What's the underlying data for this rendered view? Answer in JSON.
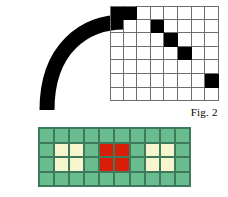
{
  "figure": {
    "caption": "Fig. 2",
    "colors": {
      "ink": "#000000",
      "grid_line": "#6e6e6e",
      "green": "#69bc8e",
      "cream": "#f7f5ce",
      "red": "#d81e09",
      "cell_border": "#3d7a5c",
      "background": "#ffffff"
    }
  },
  "pixel_grid": {
    "name": "rasterized-curve-grid",
    "columns": 8,
    "rows": 7,
    "cell_size": 13.6,
    "origin_x": 110,
    "origin_y": 6,
    "filled_cells": [
      [
        0,
        0
      ],
      [
        0,
        1
      ],
      [
        1,
        3
      ],
      [
        2,
        4
      ],
      [
        3,
        5
      ],
      [
        5,
        7
      ]
    ],
    "description": "Staircase of black pixels approximating a quarter-circle arc"
  },
  "arc": {
    "name": "thick-black-arc",
    "stroke_color": "#000000",
    "stroke_width": 15,
    "path": "M 47 110 C 47 48 85 22 124 22",
    "description": "Thick smooth quarter-arc meeting the top-left of the pixel grid"
  },
  "color_grid": {
    "name": "color-cell-grid",
    "columns": 10,
    "rows": 4,
    "origin_x": 38,
    "origin_y": 127,
    "cell_width": 15.1,
    "cell_height": 14.6,
    "legend": {
      "green": "background cell",
      "cream": "highlighted pair",
      "red": "center pair"
    },
    "cells": [
      [
        "green",
        "green",
        "green",
        "green",
        "green",
        "green",
        "green",
        "green",
        "green",
        "green"
      ],
      [
        "green",
        "cream",
        "cream",
        "green",
        "red",
        "red",
        "green",
        "cream",
        "cream",
        "green"
      ],
      [
        "green",
        "cream",
        "cream",
        "green",
        "red",
        "red",
        "green",
        "cream",
        "cream",
        "green"
      ],
      [
        "green",
        "green",
        "green",
        "green",
        "green",
        "green",
        "green",
        "green",
        "green",
        "green"
      ]
    ]
  }
}
